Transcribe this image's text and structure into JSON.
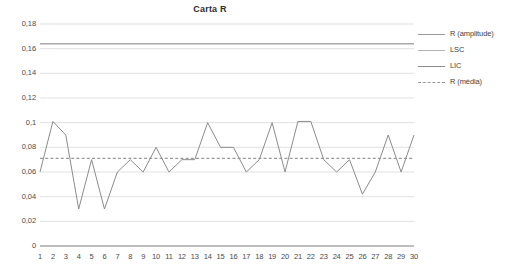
{
  "chart_data": {
    "type": "line",
    "title": "Carta R",
    "xlabel": "",
    "ylabel": "",
    "x": [
      1,
      2,
      3,
      4,
      5,
      6,
      7,
      8,
      9,
      10,
      11,
      12,
      13,
      14,
      15,
      16,
      17,
      18,
      19,
      20,
      21,
      22,
      23,
      24,
      25,
      26,
      27,
      28,
      29,
      30
    ],
    "xtick_labels": [
      "1",
      "2",
      "3",
      "4",
      "5",
      "6",
      "7",
      "8",
      "9",
      "10",
      "11",
      "12",
      "13",
      "14",
      "15",
      "16",
      "17",
      "18",
      "19",
      "20",
      "21",
      "22",
      "23",
      "24",
      "25",
      "26",
      "27",
      "28",
      "29",
      "30"
    ],
    "ytick_labels": [
      "0",
      "0,02",
      "0,04",
      "0,06",
      "0,08",
      "0,1",
      "0,12",
      "0,14",
      "0,16",
      "0,18"
    ],
    "ytick_values": [
      0,
      0.02,
      0.04,
      0.06,
      0.08,
      0.1,
      0.12,
      0.14,
      0.16,
      0.18
    ],
    "ylim": [
      0,
      0.18
    ],
    "xlim": [
      1,
      30
    ],
    "grid": true,
    "grid_axis": "y",
    "legend_position": "right",
    "series": [
      {
        "name": "R (amplitude)",
        "style": "solid",
        "color": "#8c8c8c",
        "values": [
          0.06,
          0.101,
          0.09,
          0.03,
          0.07,
          0.03,
          0.06,
          0.07,
          0.06,
          0.08,
          0.06,
          0.07,
          0.07,
          0.1,
          0.08,
          0.08,
          0.06,
          0.07,
          0.1,
          0.06,
          0.101,
          0.101,
          0.07,
          0.06,
          0.07,
          0.042,
          0.06,
          0.09,
          0.06,
          0.09
        ]
      },
      {
        "name": "LSC",
        "style": "solid",
        "color": "#a8a8a8",
        "constant": 0.164
      },
      {
        "name": "LIC",
        "style": "solid",
        "color": "#8c8c8c",
        "constant": 0.0
      },
      {
        "name": "R (média)",
        "style": "dashed",
        "color": "#9a9a9a",
        "constant": 0.071
      }
    ]
  },
  "legend": {
    "items": [
      {
        "label": "R (amplitude)",
        "swatch": "line-solid-icon"
      },
      {
        "label": "LSC",
        "swatch": "line-solid-icon"
      },
      {
        "label": "LIC",
        "swatch": "line-solid-icon"
      },
      {
        "label": "R (média)",
        "swatch": "line-dashed-icon"
      }
    ]
  },
  "colors": {
    "series": "#8c8c8c",
    "lsc": "#a8a8a8",
    "lic": "#8c8c8c",
    "mean": "#9a9a9a",
    "grid": "#d9d9d9",
    "text": "#3f3f3f",
    "background": "#ffffff"
  }
}
